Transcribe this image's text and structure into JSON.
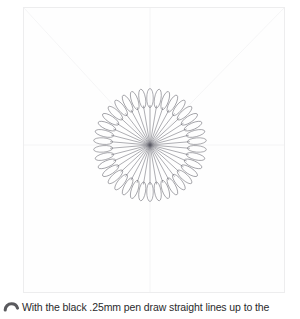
{
  "page": {
    "width": 300,
    "height": 319,
    "background_color": "#ffffff"
  },
  "drawing": {
    "frame": {
      "name": "paper-frame",
      "x": 23,
      "y": 7,
      "width": 262,
      "height": 286,
      "border_color": "#ededee",
      "fill_color": "#fefefe"
    },
    "construction_lines": {
      "color": "#f4f4f5",
      "description": "faint pencil guide lines",
      "lines": [
        {
          "name": "diagonal-top-left",
          "x1": 24,
          "y1": 8,
          "x2": 150,
          "y2": 145
        },
        {
          "name": "center-vertical",
          "x1": 150,
          "y1": 8,
          "x2": 150,
          "y2": 292
        },
        {
          "name": "center-horizontal",
          "x1": 24,
          "y1": 145,
          "x2": 284,
          "y2": 145
        },
        {
          "name": "diagonal-top-right",
          "x1": 284,
          "y1": 8,
          "x2": 150,
          "y2": 145
        }
      ]
    },
    "mandala": {
      "name": "radial-petal-mandala",
      "center_x": 150,
      "center_y": 145,
      "petal_count": 38,
      "spoke_inner_radius": 0,
      "spoke_outer_radius": 40,
      "petal_center_radius": 47,
      "petal_length": 19,
      "petal_width": 6.5,
      "outer_radius": 56,
      "stroke_color": "#5d5d66",
      "stroke_width": 0.5
    }
  },
  "caption": {
    "step_icon": "step-number-two-icon",
    "text": "With the black .25mm pen draw straight lines up to the",
    "text_color": "#2a2a2c"
  }
}
